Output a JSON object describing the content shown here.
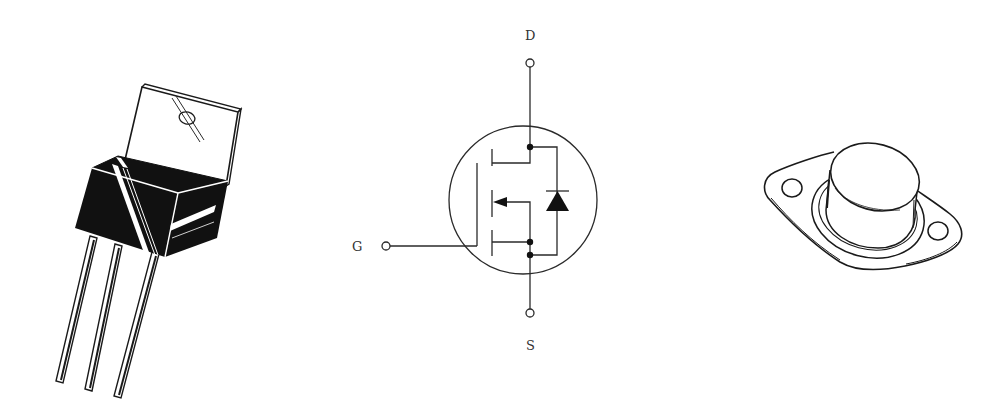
{
  "figure": {
    "colors": {
      "ink": "#2a2a2a",
      "background": "#ffffff",
      "fill_dark": "#111111"
    }
  },
  "panels": [
    {
      "id": "to220-package",
      "kind": "illustration",
      "label": ""
    },
    {
      "id": "mosfet-symbol",
      "kind": "schematic",
      "label": ""
    },
    {
      "id": "to3-package",
      "kind": "illustration",
      "label": ""
    }
  ],
  "symbol": {
    "terminals": {
      "drain": {
        "label": "D"
      },
      "gate": {
        "label": "G"
      },
      "source": {
        "label": "S"
      }
    },
    "components": [
      "n-channel enhancement MOSFET",
      "body diode"
    ]
  }
}
